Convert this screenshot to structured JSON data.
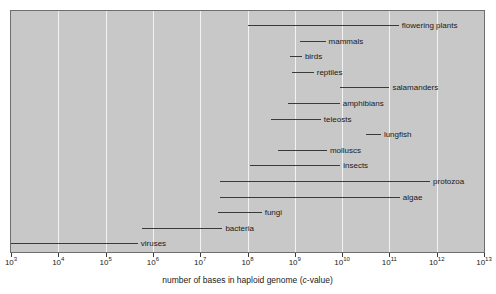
{
  "chart_data": {
    "type": "bar",
    "orientation": "horizontal-range",
    "title": "",
    "xlabel": "number of bases in haploid genome (c-value)",
    "ylabel": "",
    "xscale": "log10",
    "xlim": [
      3,
      13
    ],
    "xticks": [
      3,
      4,
      5,
      6,
      7,
      8,
      9,
      10,
      11,
      12,
      13
    ],
    "xticklabels": [
      "10³",
      "10⁴",
      "10⁵",
      "10⁶",
      "10⁷",
      "10⁸",
      "10⁹",
      "10¹⁰",
      "10¹¹",
      "10¹²",
      "10¹³"
    ],
    "xtick_mantissa": [
      "10",
      "10",
      "10",
      "10",
      "10",
      "10",
      "10",
      "10",
      "10",
      "10",
      "10"
    ],
    "xtick_exponent": [
      "3",
      "4",
      "5",
      "6",
      "7",
      "8",
      "9",
      "10",
      "11",
      "12",
      "13"
    ],
    "grid": true,
    "grid_axis": "x",
    "grid_color": "#f2f2f2",
    "plot_background": "#c8c8c8",
    "bar_color": "#3a3a3a",
    "legend": null,
    "categories": [
      "flowering plants",
      "mammals",
      "birds",
      "reptiles",
      "salamanders",
      "amphibians",
      "teleosts",
      "lungfish",
      "molluscs",
      "insects",
      "protozoa",
      "algae",
      "fungi",
      "bacteria",
      "viruses"
    ],
    "ranges": [
      {
        "name": "flowering plants",
        "start": 8.0,
        "end": 11.2,
        "label_side": "right"
      },
      {
        "name": "mammals",
        "start": 9.1,
        "end": 9.65,
        "label_side": "right"
      },
      {
        "name": "birds",
        "start": 8.9,
        "end": 9.15,
        "label_side": "right"
      },
      {
        "name": "reptiles",
        "start": 8.95,
        "end": 9.4,
        "label_side": "right"
      },
      {
        "name": "salamanders",
        "start": 9.95,
        "end": 11.0,
        "label_side": "right"
      },
      {
        "name": "amphibians",
        "start": 8.85,
        "end": 9.95,
        "label_side": "right"
      },
      {
        "name": "teleosts",
        "start": 8.5,
        "end": 9.55,
        "label_side": "right"
      },
      {
        "name": "lungfish",
        "start": 10.5,
        "end": 10.82,
        "label_side": "right"
      },
      {
        "name": "molluscs",
        "start": 8.65,
        "end": 9.68,
        "label_side": "right"
      },
      {
        "name": "insects",
        "start": 8.06,
        "end": 9.96,
        "label_side": "right"
      },
      {
        "name": "protozoa",
        "start": 7.42,
        "end": 11.86,
        "label_side": "right"
      },
      {
        "name": "algae",
        "start": 7.42,
        "end": 11.22,
        "label_side": "right"
      },
      {
        "name": "fungi",
        "start": 7.38,
        "end": 8.3,
        "label_side": "right"
      },
      {
        "name": "bacteria",
        "start": 5.78,
        "end": 7.47,
        "label_side": "right"
      },
      {
        "name": "viruses",
        "start": 3.0,
        "end": 5.68,
        "label_side": "right"
      }
    ]
  }
}
